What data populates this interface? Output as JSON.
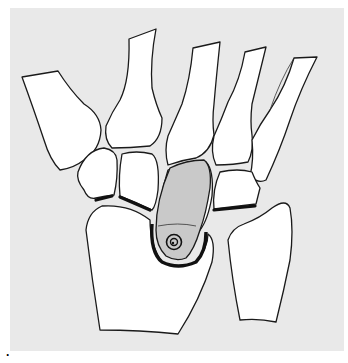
{
  "figure": {
    "label": "·",
    "colors": {
      "background_panel": "#e9e9e9",
      "bone_fill": "#ffffff",
      "outline": "#1a1a1a",
      "implant_fill": "#c9c9c9"
    },
    "elements": [
      {
        "name": "metacarpal-1"
      },
      {
        "name": "metacarpal-2"
      },
      {
        "name": "metacarpal-3"
      },
      {
        "name": "metacarpal-4"
      },
      {
        "name": "metacarpal-5"
      },
      {
        "name": "trapezium"
      },
      {
        "name": "trapezoid"
      },
      {
        "name": "capitate"
      },
      {
        "name": "hamate"
      },
      {
        "name": "scaphoid"
      },
      {
        "name": "lunate-implant"
      },
      {
        "name": "triquetrum"
      },
      {
        "name": "radius"
      },
      {
        "name": "ulna"
      }
    ]
  }
}
